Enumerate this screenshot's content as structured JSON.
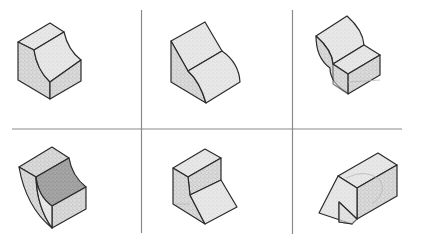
{
  "figure": {
    "layout": {
      "rows": 2,
      "columns": 3
    },
    "colors": {
      "background": "#ffffff",
      "gridline": "#8a8a8a",
      "edge": "#2a2a2a",
      "shading_light": "#e4e4e4",
      "shading_mid": "#d2d2d2",
      "shading_dark": "#a8a8a8"
    },
    "panels": [
      {
        "position": "row-1-col-1",
        "description": "Isometric block with concave curved cut on front-right face"
      },
      {
        "position": "row-1-col-2",
        "description": "Isometric wedge with flat top slope and concave curved lower face"
      },
      {
        "position": "row-1-col-3",
        "description": "Isometric L-shaped block with curved back face and low front box"
      },
      {
        "position": "row-2-col-1",
        "description": "Isometric block with concave curved cut, darker shaded inner face"
      },
      {
        "position": "row-2-col-2",
        "description": "Isometric block with upper box and inclined lower front face"
      },
      {
        "position": "row-2-col-3",
        "description": "Isometric elongated box with sloped stepped front end"
      }
    ]
  }
}
